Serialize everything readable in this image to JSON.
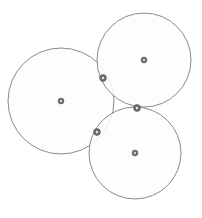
{
  "figure": {
    "width": 202,
    "height": 218,
    "background_color": "#ffffff",
    "stroke_color": "#8a8a90",
    "fill_color": "#fdfdfd",
    "marker_color": "#6e6e74"
  },
  "chart_data": {
    "type": "scatter",
    "subtitle": "",
    "xlabel": "",
    "ylabel": "",
    "xlim": [
      0,
      202
    ],
    "ylim": [
      218,
      0
    ],
    "grid": false,
    "legend": false,
    "legend_position": "none",
    "annotations": [],
    "tick_labels": {
      "x": [],
      "y": []
    },
    "series": [
      {
        "name": "circles",
        "kind": "circle-outline",
        "stroke": "#8a8a90",
        "fill": "#fdfdfd",
        "values": [
          {
            "label": "left-circle",
            "cx": 61,
            "cy": 101,
            "r": 53
          },
          {
            "label": "top-right-circle",
            "cx": 144,
            "cy": 60,
            "r": 47
          },
          {
            "label": "bottom-right-circle",
            "cx": 135,
            "cy": 153,
            "r": 46
          }
        ]
      },
      {
        "name": "centers",
        "kind": "point-marker",
        "color": "#6e6e74",
        "values": [
          {
            "label": "left-circle-center",
            "x": 61,
            "y": 101
          },
          {
            "label": "top-right-circle-center",
            "x": 144,
            "y": 60
          },
          {
            "label": "bottom-right-circle-center",
            "x": 135,
            "y": 153
          }
        ]
      },
      {
        "name": "tangency-points",
        "kind": "point-marker",
        "color": "#6e6e74",
        "values": [
          {
            "label": "tangency-left-topright",
            "x": 103,
            "y": 78
          },
          {
            "label": "tangency-topright-bottomright",
            "x": 137,
            "y": 108
          },
          {
            "label": "tangency-left-bottomright",
            "x": 97,
            "y": 132
          }
        ]
      }
    ]
  }
}
